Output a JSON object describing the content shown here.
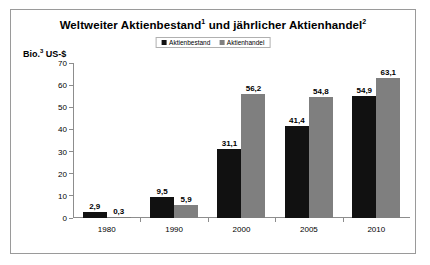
{
  "chart_data": {
    "type": "bar",
    "title_main_a": "Weltweiter Aktienbestand",
    "title_sup_a": "1",
    "title_mid": " und jährlicher Aktienhandel",
    "title_sup_b": "2",
    "subtitle": "",
    "xlabel": "",
    "ylabel": "Bio.³ US-$",
    "ylabel_text": "Bio.",
    "ylabel_sup": "3",
    "ylabel_unit": " US-$",
    "ylim": [
      0,
      70
    ],
    "ytick_step": 10,
    "yticks": [
      0,
      10,
      20,
      30,
      40,
      50,
      60,
      70
    ],
    "ytick_labels": [
      "0",
      "10",
      "20",
      "30",
      "40",
      "50",
      "60",
      "70"
    ],
    "categories": [
      "1980",
      "1990",
      "2000",
      "2005",
      "2010"
    ],
    "grid": false,
    "legend_position": "top-center",
    "series": [
      {
        "name": "Aktienbestand",
        "color": "#111111",
        "values": [
          2.9,
          9.5,
          31.1,
          41.4,
          54.9
        ],
        "labels": [
          "2,9",
          "9,5",
          "31,1",
          "41,4",
          "54,9"
        ]
      },
      {
        "name": "Aktienhandel",
        "color": "#7f7f7f",
        "values": [
          0.3,
          5.9,
          56.2,
          54.8,
          63.1
        ],
        "labels": [
          "0,3",
          "5,9",
          "56,2",
          "54,8",
          "63,1"
        ]
      }
    ]
  },
  "legend": {
    "items": [
      {
        "label": "Aktienbestand",
        "color": "#111111"
      },
      {
        "label": "Aktienhandel",
        "color": "#7f7f7f"
      }
    ]
  },
  "colors": {
    "series_0": "#111111",
    "series_1": "#7f7f7f",
    "axis": "#8d8d8d",
    "frame": "#9a9a9a",
    "background": "#ffffff",
    "text": "#000000"
  }
}
